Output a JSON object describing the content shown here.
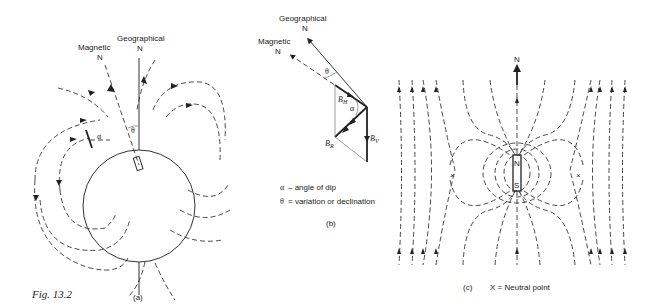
{
  "figure": {
    "caption": "Fig. 13.2",
    "panels": {
      "a": {
        "label": "(a)",
        "magnetic_label_line1": "Magnetic",
        "magnetic_label_line2": "N",
        "geographical_label_line1": "Geographical",
        "geographical_label_line2": "N",
        "theta_symbol": "θ",
        "alpha_symbol": "α"
      },
      "b": {
        "label": "(b)",
        "geographical_label_line1": "Geographical",
        "geographical_label_line2": "N",
        "magnetic_label_line1": "Magnetic",
        "magnetic_label_line2": "N",
        "theta_symbol": "θ",
        "alpha_symbol": "α",
        "bh_label": "B",
        "bh_sub": "H",
        "bv_label": "B",
        "bv_sub": "V",
        "br_label": "B",
        "br_sub": "R",
        "legend": [
          {
            "symbol": "α",
            "text": "–  angle of dip"
          },
          {
            "symbol": "θ",
            "text": "=  variation or declination"
          }
        ]
      },
      "c": {
        "label": "(c)",
        "north_label": "N",
        "magnet_north": "N",
        "magnet_south": "S",
        "neutral_marker": "×",
        "legend_text": "X = Neutral point"
      }
    }
  }
}
